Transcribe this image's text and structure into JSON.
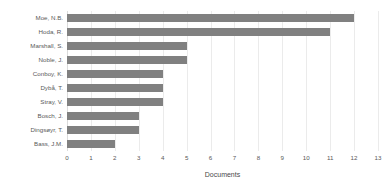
{
  "chart_data": {
    "type": "bar",
    "orientation": "horizontal",
    "title": "",
    "xlabel": "Documents",
    "ylabel": "",
    "xlim": [
      0,
      13
    ],
    "xticks": [
      "0",
      "1",
      "2",
      "3",
      "4",
      "5",
      "6",
      "7",
      "8",
      "9",
      "10",
      "11",
      "12",
      "13"
    ],
    "grid": true,
    "legend": false,
    "bar_color": "#808080",
    "categories": [
      "Moe, N.B.",
      "Hoda, R.",
      "Marshall, S.",
      "Noble, J.",
      "Conboy, K.",
      "Dybå, T.",
      "Stray, V.",
      "Bosch, J.",
      "Dingsøyr, T.",
      "Bass, J.M."
    ],
    "values": [
      12,
      11,
      5,
      5,
      4,
      4,
      4,
      3,
      3,
      2
    ]
  }
}
